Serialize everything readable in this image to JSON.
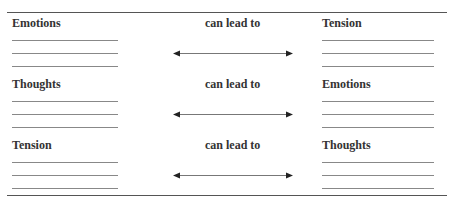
{
  "rows": [
    {
      "left": "Emotions",
      "middle": "can lead to",
      "right": "Tension"
    },
    {
      "left": "Thoughts",
      "middle": "can lead to",
      "right": "Emotions"
    },
    {
      "left": "Tension",
      "middle": "can lead to",
      "right": "Thoughts"
    }
  ],
  "arrow_icon": "double-headed-arrow"
}
